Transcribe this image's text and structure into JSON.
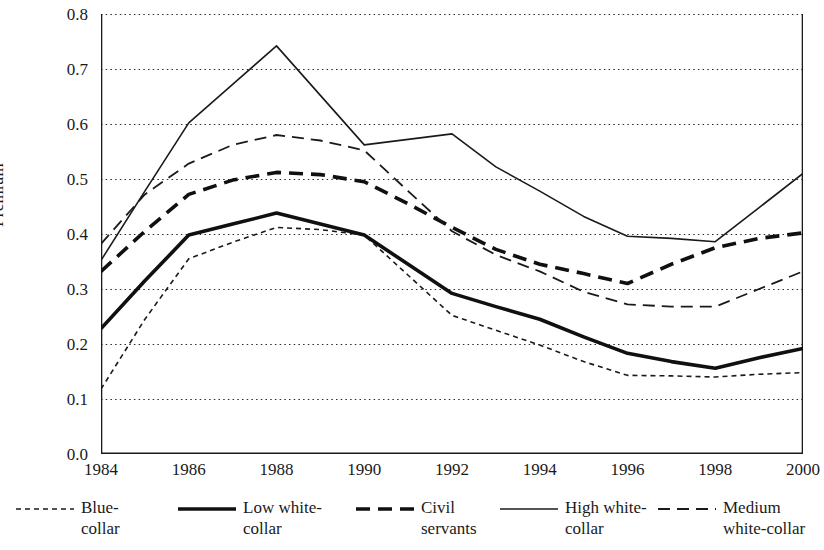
{
  "chart_data": {
    "type": "line",
    "title": "",
    "xlabel": "",
    "ylabel": "Premium",
    "xlim": [
      1984,
      2000
    ],
    "ylim": [
      0.0,
      0.8
    ],
    "grid": true,
    "legend_position": "bottom",
    "x": [
      1984,
      1985,
      1986,
      1987,
      1988,
      1989,
      1990,
      1991,
      1992,
      1993,
      1994,
      1995,
      1996,
      1997,
      1998,
      1999,
      2000
    ],
    "xticks": [
      "1984",
      "1986",
      "1988",
      "1990",
      "1992",
      "1994",
      "1996",
      "1998",
      "2000"
    ],
    "yticks": [
      "0.0",
      "0.1",
      "0.2",
      "0.3",
      "0.4",
      "0.5",
      "0.6",
      "0.7",
      "0.8"
    ],
    "series": [
      {
        "name": "Blue-collar",
        "label": "Blue-\ncollar",
        "style": "fine-dotted",
        "color": "#1a1a1a",
        "width": 1.6,
        "dash": "5,4",
        "values": [
          0.118,
          0.245,
          0.355,
          0.385,
          0.412,
          0.408,
          0.398,
          0.325,
          0.252,
          0.225,
          0.198,
          0.168,
          0.143,
          0.142,
          0.14,
          0.145,
          0.148
        ]
      },
      {
        "name": "Low white-collar",
        "label": "Low white-\ncollar",
        "style": "thick-solid",
        "color": "#101010",
        "width": 3.6,
        "dash": "",
        "values": [
          0.228,
          0.315,
          0.398,
          0.418,
          0.438,
          0.418,
          0.398,
          0.345,
          0.292,
          0.268,
          0.245,
          0.213,
          0.183,
          0.168,
          0.156,
          0.175,
          0.192
        ]
      },
      {
        "name": "Civil servants",
        "label": "Civil\nservants",
        "style": "thick-dashed",
        "color": "#101010",
        "width": 3.6,
        "dash": "14,8",
        "values": [
          0.332,
          0.405,
          0.472,
          0.498,
          0.512,
          0.508,
          0.495,
          0.455,
          0.412,
          0.372,
          0.345,
          0.328,
          0.31,
          0.345,
          0.375,
          0.392,
          0.402
        ]
      },
      {
        "name": "High white-collar",
        "label": "High white-\ncollar",
        "style": "thin-solid",
        "color": "#1a1a1a",
        "width": 1.6,
        "dash": "",
        "values": [
          0.352,
          0.478,
          0.602,
          0.672,
          0.742,
          0.652,
          0.562,
          0.572,
          0.582,
          0.522,
          0.478,
          0.432,
          0.396,
          0.392,
          0.386,
          0.448,
          0.51
        ]
      },
      {
        "name": "Medium white-collar",
        "label": "Medium\nwhite-collar",
        "style": "thin-dashed",
        "color": "#1a1a1a",
        "width": 1.8,
        "dash": "12,7",
        "values": [
          0.382,
          0.472,
          0.528,
          0.562,
          0.58,
          0.57,
          0.552,
          0.478,
          0.405,
          0.362,
          0.332,
          0.295,
          0.272,
          0.268,
          0.268,
          0.3,
          0.332
        ]
      }
    ]
  }
}
